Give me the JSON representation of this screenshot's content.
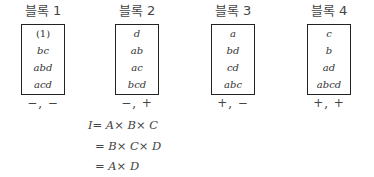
{
  "blocks": [
    {
      "title": "블록 1",
      "items": [
        "(1)",
        "bc",
        "abd",
        "acd"
      ],
      "signs": "−, −"
    },
    {
      "title": "블록 2",
      "items": [
        "d",
        "ab",
        "ac",
        "bcd"
      ],
      "signs": "−, +"
    },
    {
      "title": "블록 3",
      "items": [
        "a",
        "bd",
        "cd",
        "abc"
      ],
      "signs": "+, −"
    },
    {
      "title": "블록 4",
      "items": [
        "c",
        "b",
        "ad",
        "abcd"
      ],
      "signs": "+, +"
    }
  ],
  "equations": [
    "I= A× B× C",
    "= B× C× D",
    "= A× D"
  ]
}
